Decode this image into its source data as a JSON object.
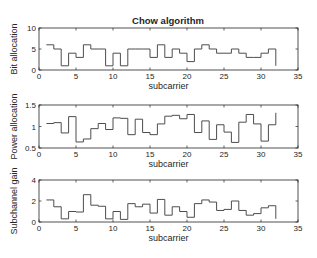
{
  "figure": {
    "title": "Chow algorithm",
    "background": "#ffffff",
    "axis_color": "#262626",
    "line_color": "#4d4d4d"
  },
  "chart_data": [
    {
      "type": "line",
      "style": "stairs",
      "title": "Chow algorithm",
      "xlabel": "subcarrier",
      "ylabel": "Bit allocation",
      "xlim": [
        0,
        35
      ],
      "ylim": [
        0,
        10
      ],
      "xticks": [
        0,
        5,
        10,
        15,
        20,
        25,
        30,
        35
      ],
      "yticks": [
        0,
        5,
        10
      ],
      "grid": false,
      "x": [
        1,
        2,
        3,
        4,
        5,
        6,
        7,
        8,
        9,
        10,
        11,
        12,
        13,
        14,
        15,
        16,
        17,
        18,
        19,
        20,
        21,
        22,
        23,
        24,
        25,
        26,
        27,
        28,
        29,
        30,
        31,
        32
      ],
      "values": [
        6,
        5,
        1,
        4,
        3,
        6,
        5,
        5,
        1,
        4,
        1,
        5,
        5,
        5,
        3,
        6,
        3,
        5,
        4,
        2,
        5,
        6,
        5,
        4,
        4,
        5,
        4,
        3,
        3,
        4,
        5,
        1
      ]
    },
    {
      "type": "line",
      "style": "stairs",
      "title": "",
      "xlabel": "subcarrier",
      "ylabel": "Power allocation",
      "xlim": [
        0,
        35
      ],
      "ylim": [
        0.5,
        1.5
      ],
      "xticks": [
        0,
        5,
        10,
        15,
        20,
        25,
        30,
        35
      ],
      "yticks": [
        0.5,
        1,
        1.5
      ],
      "grid": false,
      "x": [
        1,
        2,
        3,
        4,
        5,
        6,
        7,
        8,
        9,
        10,
        11,
        12,
        13,
        14,
        15,
        16,
        17,
        18,
        19,
        20,
        21,
        22,
        23,
        24,
        25,
        26,
        27,
        28,
        29,
        30,
        31,
        32
      ],
      "values": [
        1.07,
        1.09,
        0.85,
        1.23,
        0.64,
        0.71,
        0.95,
        1.07,
        0.93,
        1.2,
        1.19,
        0.81,
        1.17,
        0.86,
        0.81,
        1.06,
        1.24,
        1.26,
        1.18,
        1.28,
        0.86,
        1.13,
        0.7,
        1.04,
        0.87,
        0.63,
        1.1,
        1.28,
        1.06,
        0.66,
        1.04,
        1.32
      ]
    },
    {
      "type": "line",
      "style": "stairs",
      "title": "",
      "xlabel": "subcarrier",
      "ylabel": "Subchannel gain",
      "xlim": [
        0,
        35
      ],
      "ylim": [
        0,
        4
      ],
      "xticks": [
        0,
        5,
        10,
        15,
        20,
        25,
        30,
        35
      ],
      "yticks": [
        0,
        2,
        4
      ],
      "grid": false,
      "x": [
        1,
        2,
        3,
        4,
        5,
        6,
        7,
        8,
        9,
        10,
        11,
        12,
        13,
        14,
        15,
        16,
        17,
        18,
        19,
        20,
        21,
        22,
        23,
        24,
        25,
        26,
        27,
        28,
        29,
        30,
        31,
        32
      ],
      "values": [
        2.1,
        1.45,
        0.3,
        1.0,
        0.95,
        2.6,
        1.6,
        1.5,
        0.3,
        1.0,
        0.25,
        1.75,
        1.45,
        1.7,
        0.85,
        2.15,
        0.65,
        1.45,
        1.0,
        0.45,
        1.75,
        2.1,
        1.9,
        1.1,
        1.2,
        2.0,
        1.1,
        0.65,
        0.8,
        1.35,
        1.55,
        0.3
      ]
    }
  ],
  "layout": {
    "axes": [
      {
        "left": 39,
        "top": 28,
        "width": 259,
        "height": 42
      },
      {
        "left": 39,
        "top": 105,
        "width": 259,
        "height": 43
      },
      {
        "left": 39,
        "top": 180,
        "width": 259,
        "height": 42
      }
    ]
  }
}
